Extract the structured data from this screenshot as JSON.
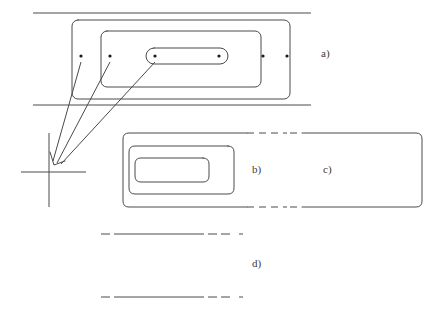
{
  "figure": {
    "type": "technical-line-diagram",
    "width": 443,
    "height": 311,
    "background_color": "#ffffff",
    "line_color": "#4a4a4a",
    "dot_color": "#1a1a1a"
  },
  "labels": {
    "panel_a": "a)",
    "panel_b": "b)",
    "panel_c": "c)",
    "panel_d": "d)"
  },
  "label_positions": {
    "panel_a": {
      "x": 321,
      "y": 47
    },
    "panel_b": {
      "x": 252,
      "y": 163
    },
    "panel_c": {
      "x": 323,
      "y": 163
    },
    "panel_d": {
      "x": 252,
      "y": 257
    }
  },
  "panel_a": {
    "guide_lines": [
      {
        "x1": 33,
        "y1": 13,
        "x2": 311,
        "y2": 13
      },
      {
        "x1": 33,
        "y1": 105,
        "x2": 311,
        "y2": 105
      }
    ],
    "outer_rect": {
      "x": 72,
      "y": 20,
      "width": 218,
      "height": 79,
      "rx": 6
    },
    "middle_rect": {
      "x": 101,
      "y": 31,
      "width": 160,
      "height": 56,
      "rx": 6
    },
    "inner_rect": {
      "x": 146,
      "y": 48,
      "width": 82,
      "height": 16,
      "rx": 8
    },
    "dots": [
      {
        "cx": 81,
        "cy": 56,
        "r": 1.6
      },
      {
        "cx": 110,
        "cy": 56,
        "r": 1.6
      },
      {
        "cx": 155,
        "cy": 56,
        "r": 1.6
      },
      {
        "cx": 219,
        "cy": 56,
        "r": 1.6
      },
      {
        "cx": 263,
        "cy": 56,
        "r": 1.6
      },
      {
        "cx": 287,
        "cy": 56,
        "r": 1.6
      }
    ]
  },
  "leader_lines": [
    {
      "x1": 81,
      "y1": 62,
      "x2": 53,
      "y2": 161
    },
    {
      "x1": 110,
      "y1": 62,
      "x2": 56,
      "y2": 163
    },
    {
      "x1": 155,
      "y1": 62,
      "x2": 59,
      "y2": 164
    }
  ],
  "arrowhead": {
    "points": "50,153 53,164 64,161"
  },
  "axis_cross": {
    "vertical": {
      "x1": 49,
      "y1": 133,
      "x2": 49,
      "y2": 207
    },
    "horizontal": {
      "x1": 21,
      "y1": 172,
      "x2": 86,
      "y2": 172
    }
  },
  "panel_b": {
    "outer_u": {
      "description": "rounded rectangle open to the right",
      "path": "M 247 133 L 129 133 Q 123 133 123 139 L 123 201 Q 123 207 129 207 L 247 207"
    },
    "middle_u": {
      "path": "M 228 146 L 135 146 Q 129 146 129 152 L 129 188 Q 129 194 135 194 L 228 194"
    },
    "middle_u_right_cap": {
      "path": "M 228 146 Q 234 146 234 152 L 234 188 Q 234 194 228 194"
    },
    "inner_u": {
      "path": "M 203 158 L 141 158 Q 135 158 135 164 L 135 176 Q 135 182 141 182 L 203 182"
    },
    "inner_u_right_cap": {
      "path": "M 203 158 Q 209 158 209 164 L 209 176 Q 209 182 203 182"
    },
    "dashed_top": {
      "x1": 247,
      "y1": 133,
      "x2": 285,
      "y2": 133
    },
    "dashed_bottom": {
      "x1": 247,
      "y1": 207,
      "x2": 285,
      "y2": 207
    }
  },
  "panel_c": {
    "open_rect": {
      "description": "rounded rectangle open to the left",
      "path": "M 300 133 L 416 133 Q 422 133 422 139 L 422 201 Q 422 207 416 207 L 300 207"
    },
    "dashed_top": {
      "x1": 292,
      "y1": 133,
      "x2": 300,
      "y2": 133
    },
    "dashed_bottom": {
      "x1": 292,
      "y1": 207,
      "x2": 300,
      "y2": 207
    }
  },
  "panel_d": {
    "line_top": {
      "x1": 101,
      "y1": 234,
      "x2": 306,
      "y2": 234
    },
    "line_bottom": {
      "x1": 101,
      "y1": 297,
      "x2": 306,
      "y2": 297
    },
    "dash_pattern": "6 4"
  }
}
